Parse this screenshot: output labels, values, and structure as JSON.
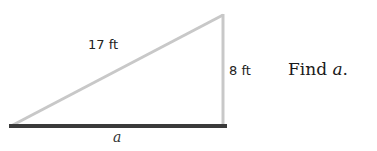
{
  "figure": {
    "type": "right-triangle",
    "hypotenuse_label": "17 ft",
    "vertical_leg_label": "8 ft",
    "base_label": "a",
    "colors": {
      "hypotenuse": "#c8c8c8",
      "vertical_leg": "#c8c8c8",
      "base": "#3a3a3a"
    }
  },
  "question": {
    "prefix": "Find ",
    "variable": "a",
    "suffix": "."
  }
}
